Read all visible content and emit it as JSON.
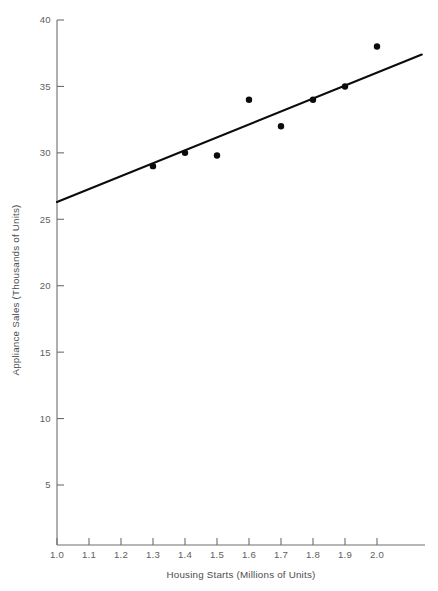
{
  "figure": {
    "top_cropped_caption": "",
    "background_color": "#ffffff",
    "ink_color": "#0c0c0c",
    "axis_color": "#6e6e70"
  },
  "chart_data": {
    "type": "scatter",
    "title": "",
    "subtitle": "",
    "xlabel": "Housing Starts (Millions of Units)",
    "ylabel": "Appliance Sales (Thousands of Units)",
    "xlim": [
      1.0,
      2.15
    ],
    "ylim": [
      0,
      40
    ],
    "grid": false,
    "legend": null,
    "x_ticks": [
      1.0,
      1.1,
      1.2,
      1.3,
      1.4,
      1.5,
      1.6,
      1.7,
      1.8,
      1.9,
      2.0
    ],
    "x_tick_labels": [
      "1.0",
      "1.1",
      "1.2",
      "1.3",
      "1.4",
      "1.5",
      "1.6",
      "1.7",
      "1.8",
      "1.9",
      "2.0"
    ],
    "y_ticks": [
      5,
      10,
      15,
      20,
      25,
      30,
      35,
      40
    ],
    "y_tick_labels": [
      "5",
      "10",
      "15",
      "20",
      "25",
      "30",
      "35",
      "40"
    ],
    "points": [
      {
        "x": 1.3,
        "y": 29
      },
      {
        "x": 1.4,
        "y": 30
      },
      {
        "x": 1.5,
        "y": 29.8
      },
      {
        "x": 1.6,
        "y": 34
      },
      {
        "x": 1.7,
        "y": 32
      },
      {
        "x": 1.8,
        "y": 34
      },
      {
        "x": 1.9,
        "y": 35
      },
      {
        "x": 2.0,
        "y": 38
      }
    ],
    "series": [
      {
        "name": "Observations",
        "type": "scatter",
        "x": [
          1.3,
          1.4,
          1.5,
          1.6,
          1.7,
          1.8,
          1.9,
          2.0
        ],
        "values": [
          29,
          30,
          29.8,
          34,
          32,
          34,
          35,
          38
        ]
      },
      {
        "name": "Regression line",
        "type": "line",
        "x": [
          1.0,
          2.14
        ],
        "values": [
          26.3,
          37.4
        ]
      }
    ],
    "annotations": []
  },
  "axes": {
    "x_title": "Housing Starts (Millions of Units)",
    "y_title": "Appliance Sales (Thousands of Units)"
  }
}
